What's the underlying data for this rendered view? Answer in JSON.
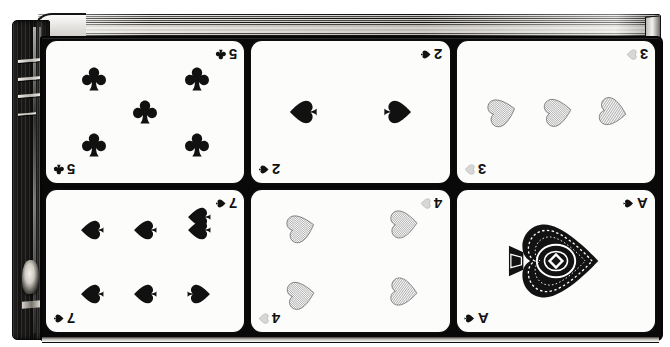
{
  "illustration": {
    "title": "Playing cards displayed on a book cover",
    "style": "antique black-and-white engraving",
    "background_color": "#ffffff",
    "ink_color": "#111111",
    "board_color": "#090909",
    "card_color": "#fcfcfa"
  },
  "book": {
    "spine_label": "book-spine",
    "spine_color": "#141312",
    "page_edge_label": "page-edges",
    "band_count": 4,
    "crest_label": "spine-crest-ornament"
  },
  "cards": [
    {
      "id": "five-of-clubs",
      "rank": "5",
      "suit": "clubs",
      "suit_glyph": "♣",
      "pip_count": 5,
      "index_rank": "5",
      "row": 1,
      "column": 1,
      "fill": "solid-black"
    },
    {
      "id": "two-of-spades",
      "rank": "2",
      "suit": "spades",
      "suit_glyph": "♠",
      "pip_count": 2,
      "index_rank": "2",
      "row": 1,
      "column": 2,
      "fill": "solid-black"
    },
    {
      "id": "three-of-hearts",
      "rank": "3",
      "suit": "hearts",
      "suit_glyph": "♥",
      "pip_count": 3,
      "index_rank": "3",
      "row": 1,
      "column": 3,
      "fill": "hatched-grey"
    },
    {
      "id": "seven-of-spades",
      "rank": "7",
      "suit": "spades",
      "suit_glyph": "♠",
      "pip_count": 7,
      "index_rank": "7",
      "row": 2,
      "column": 1,
      "fill": "solid-black"
    },
    {
      "id": "four-of-hearts",
      "rank": "4",
      "suit": "hearts",
      "suit_glyph": "♥",
      "pip_count": 4,
      "index_rank": "4",
      "row": 2,
      "column": 2,
      "fill": "hatched-grey"
    },
    {
      "id": "ace-of-spades",
      "rank": "A",
      "suit": "spades",
      "suit_glyph": "♠",
      "pip_count": 1,
      "index_rank": "A",
      "row": 2,
      "column": 3,
      "fill": "ornate-engraved",
      "note": "large decorated ace pip, rotated"
    }
  ]
}
